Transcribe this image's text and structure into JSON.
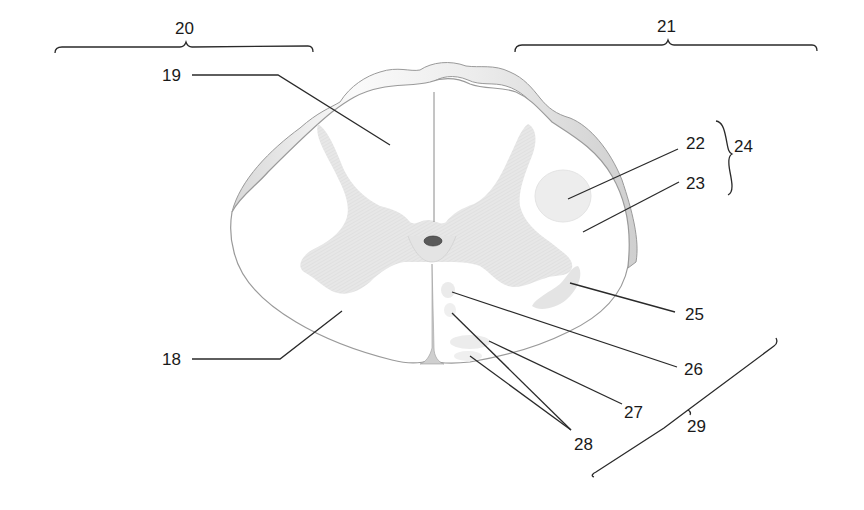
{
  "diagram": {
    "colors": {
      "gray_matter": "#e6e6e6",
      "white_matter": "#ffffff",
      "outline": "#9a9a9a",
      "pia_band": "#f3f3f3",
      "leader_line": "#2a2a2a",
      "canal": "#5a5a5a"
    },
    "labels": [
      {
        "id": "18",
        "text": "18"
      },
      {
        "id": "19",
        "text": "19"
      },
      {
        "id": "20",
        "text": "20"
      },
      {
        "id": "21",
        "text": "21"
      },
      {
        "id": "22",
        "text": "22"
      },
      {
        "id": "23",
        "text": "23"
      },
      {
        "id": "24",
        "text": "24"
      },
      {
        "id": "25",
        "text": "25"
      },
      {
        "id": "26",
        "text": "26"
      },
      {
        "id": "27",
        "text": "27"
      },
      {
        "id": "28",
        "text": "28"
      },
      {
        "id": "29",
        "text": "29"
      }
    ]
  }
}
